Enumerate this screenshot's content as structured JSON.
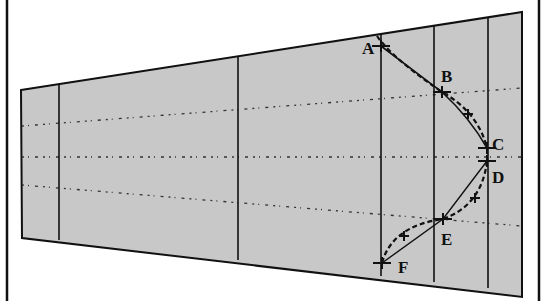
{
  "diagram": {
    "type": "wing-planform-with-curves",
    "colors": {
      "background": "#ffffff",
      "planform_fill": "#c8c8c8",
      "stroke": "#111111"
    },
    "frame": {
      "left_x": 7,
      "right_x": 539
    },
    "planform": {
      "points": [
        [
          21,
          90
        ],
        [
          522,
          12
        ],
        [
          522,
          297
        ],
        [
          22,
          238
        ]
      ]
    },
    "span_stations": [
      {
        "x": 59,
        "y_top": 84,
        "y_bottom": 240
      },
      {
        "x": 238,
        "y_top": 56,
        "y_bottom": 260
      },
      {
        "x": 381,
        "y_top": 34,
        "y_bottom": 276
      },
      {
        "x": 434,
        "y_top": 26,
        "y_bottom": 282
      },
      {
        "x": 488,
        "y_top": 18,
        "y_bottom": 288
      }
    ],
    "dotted_lines": [
      {
        "x1": 22,
        "y1": 126,
        "x2": 522,
        "y2": 88
      },
      {
        "x1": 22,
        "y1": 157,
        "x2": 522,
        "y2": 157
      },
      {
        "x1": 22,
        "y1": 185,
        "x2": 522,
        "y2": 226
      }
    ],
    "points": [
      {
        "label": "A",
        "x": 381,
        "y": 46,
        "label_x": 362,
        "label_y": 54
      },
      {
        "label": "B",
        "x": 442,
        "y": 92,
        "label_x": 441,
        "label_y": 82
      },
      {
        "label": "C",
        "x": 487,
        "y": 148,
        "label_x": 492,
        "label_y": 150
      },
      {
        "label": "D",
        "x": 487,
        "y": 161,
        "label_x": 492,
        "label_y": 183
      },
      {
        "label": "E",
        "x": 443,
        "y": 219,
        "label_x": 441,
        "label_y": 245
      },
      {
        "label": "F",
        "x": 382,
        "y": 263,
        "label_x": 398,
        "label_y": 273
      }
    ],
    "intermediate_markers": [
      {
        "x": 468,
        "y": 114
      },
      {
        "x": 475,
        "y": 198
      },
      {
        "x": 404,
        "y": 236
      }
    ]
  }
}
